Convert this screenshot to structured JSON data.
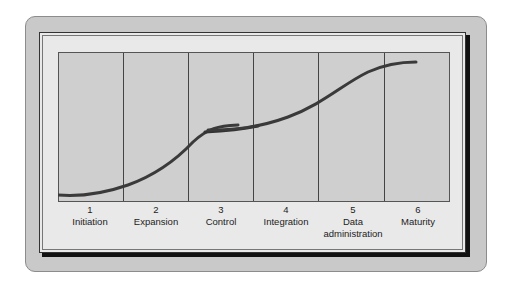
{
  "diagram": {
    "type": "s-curve stages",
    "stages": [
      {
        "number": "1",
        "name": "Initiation"
      },
      {
        "number": "2",
        "name": "Expansion"
      },
      {
        "number": "3",
        "name": "Control"
      },
      {
        "number": "4",
        "name": "Integration"
      },
      {
        "number": "5",
        "name": "Data",
        "name2": "administration"
      },
      {
        "number": "6",
        "name": "Maturity"
      }
    ],
    "colors": {
      "frame": "#c9c9c9",
      "panel": "#e9e9e9",
      "plot": "#cfcfcf",
      "curve": "#3a3a3a"
    }
  }
}
